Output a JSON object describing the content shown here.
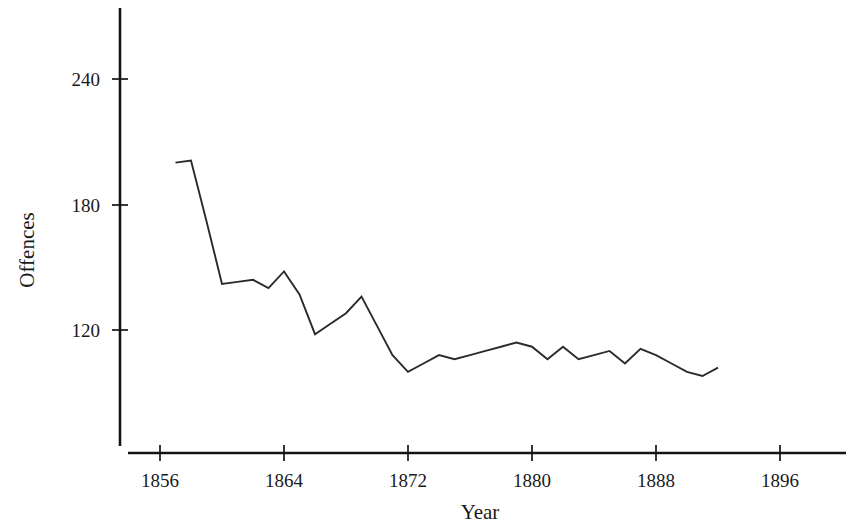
{
  "chart_data": {
    "type": "line",
    "title": "",
    "xlabel": "Year",
    "ylabel": "Offences",
    "xlim": [
      1853,
      1900
    ],
    "ylim": [
      60,
      258
    ],
    "grid": false,
    "legend": "none",
    "x_ticks": [
      1856,
      1864,
      1872,
      1880,
      1888,
      1896
    ],
    "x_tick_labels": [
      "1856",
      "1864",
      "1872",
      "1880",
      "1888",
      "1896"
    ],
    "y_ticks": [
      120,
      180,
      240
    ],
    "y_tick_labels": [
      "120",
      "180",
      "240"
    ],
    "series": [
      {
        "name": "Offences",
        "x": [
          1857,
          1858,
          1859,
          1860,
          1861,
          1862,
          1863,
          1864,
          1865,
          1866,
          1867,
          1868,
          1869,
          1870,
          1871,
          1872,
          1873,
          1874,
          1875,
          1876,
          1877,
          1878,
          1879,
          1880,
          1881,
          1882,
          1883,
          1884,
          1885,
          1886,
          1887,
          1888,
          1889,
          1890,
          1891,
          1892
        ],
        "values": [
          200,
          201,
          172,
          142,
          143,
          144,
          140,
          148,
          137,
          118,
          123,
          128,
          136,
          122,
          108,
          100,
          104,
          108,
          106,
          108,
          110,
          112,
          114,
          112,
          106,
          112,
          106,
          108,
          110,
          104,
          111,
          108,
          104,
          100,
          98,
          102
        ]
      }
    ]
  },
  "axes": {
    "y_title": "Offences",
    "x_title": "Year"
  }
}
